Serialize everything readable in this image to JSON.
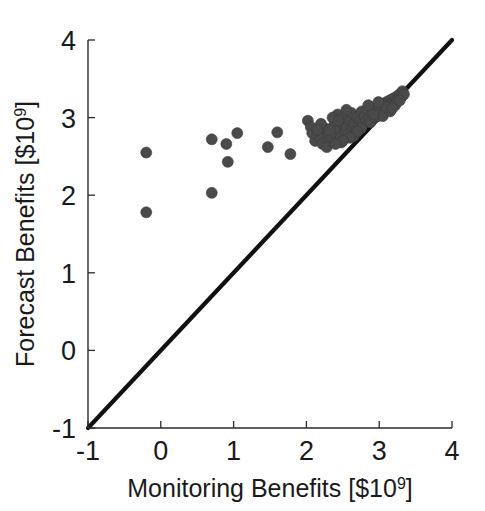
{
  "figure": {
    "background_color": "#ffffff",
    "axis_color": "#2b2b2b",
    "marker_color": "#4a4a4a",
    "line_color": "#111111"
  },
  "chart_data": {
    "type": "scatter",
    "title": "",
    "xlabel": "Monitoring Benefits [$10⁹]",
    "ylabel": "Forecast Benefits [$10⁹]",
    "xlabel_parts": {
      "text": "Monitoring Benefits [$10",
      "sup": "9",
      "tail": "]"
    },
    "ylabel_parts": {
      "text": "Forecast Benefits [$10",
      "sup": "9",
      "tail": "]"
    },
    "xlim": [
      -1,
      4
    ],
    "ylim": [
      -1,
      4
    ],
    "xticks": [
      -1,
      0,
      1,
      2,
      3,
      4
    ],
    "yticks": [
      -1,
      0,
      1,
      2,
      3,
      4
    ],
    "xtick_labels": [
      "-1",
      "0",
      "1",
      "2",
      "3",
      "4"
    ],
    "ytick_labels": [
      "-1",
      "0",
      "1",
      "2",
      "3",
      "4"
    ],
    "grid": false,
    "legend": null,
    "annotations": [],
    "reference_line": {
      "name": "one-to-one-line",
      "type": "identity",
      "from": [
        -1,
        -1
      ],
      "to": [
        4,
        4
      ]
    },
    "series": [
      {
        "name": "benefit pairs",
        "marker": "circle",
        "marker_size": 11,
        "color": "#4a4a4a",
        "points": [
          [
            -0.2,
            2.55
          ],
          [
            -0.2,
            1.78
          ],
          [
            0.7,
            2.72
          ],
          [
            0.7,
            2.03
          ],
          [
            0.9,
            2.66
          ],
          [
            0.92,
            2.43
          ],
          [
            1.05,
            2.8
          ],
          [
            1.47,
            2.62
          ],
          [
            1.6,
            2.81
          ],
          [
            1.78,
            2.53
          ],
          [
            2.02,
            2.96
          ],
          [
            2.06,
            2.88
          ],
          [
            2.12,
            2.7
          ],
          [
            2.18,
            2.75
          ],
          [
            2.22,
            2.66
          ],
          [
            2.26,
            2.86
          ],
          [
            2.3,
            2.79
          ],
          [
            2.34,
            2.72
          ],
          [
            2.38,
            2.9
          ],
          [
            2.4,
            2.8
          ],
          [
            2.43,
            3.04
          ],
          [
            2.45,
            2.84
          ],
          [
            2.47,
            2.74
          ],
          [
            2.5,
            2.92
          ],
          [
            2.52,
            3.0
          ],
          [
            2.54,
            2.82
          ],
          [
            2.56,
            2.88
          ],
          [
            2.58,
            2.79
          ],
          [
            2.6,
            2.96
          ],
          [
            2.62,
            3.06
          ],
          [
            2.64,
            2.86
          ],
          [
            2.66,
            2.92
          ],
          [
            2.68,
            2.83
          ],
          [
            2.7,
            3.0
          ],
          [
            2.72,
            2.9
          ],
          [
            2.74,
            2.97
          ],
          [
            2.76,
            3.08
          ],
          [
            2.78,
            2.93
          ],
          [
            2.8,
            3.02
          ],
          [
            2.82,
            2.96
          ],
          [
            2.84,
            3.1
          ],
          [
            2.86,
            3.0
          ],
          [
            2.88,
            2.94
          ],
          [
            2.9,
            3.06
          ],
          [
            2.92,
            3.12
          ],
          [
            2.94,
            3.0
          ],
          [
            2.96,
            3.08
          ],
          [
            2.98,
            3.02
          ],
          [
            3.0,
            3.14
          ],
          [
            3.02,
            3.06
          ],
          [
            3.04,
            3.1
          ],
          [
            3.06,
            3.18
          ],
          [
            3.08,
            3.12
          ],
          [
            3.1,
            3.2
          ],
          [
            3.12,
            3.14
          ],
          [
            3.14,
            3.22
          ],
          [
            3.16,
            3.18
          ],
          [
            3.18,
            3.24
          ],
          [
            3.2,
            3.2
          ],
          [
            3.22,
            3.26
          ],
          [
            3.24,
            3.22
          ],
          [
            3.26,
            3.28
          ],
          [
            3.28,
            3.3
          ],
          [
            3.3,
            3.26
          ],
          [
            3.32,
            3.34
          ],
          [
            3.34,
            3.3
          ],
          [
            2.36,
            3.0
          ],
          [
            2.48,
            2.68
          ],
          [
            2.2,
            2.92
          ],
          [
            2.28,
            2.62
          ],
          [
            2.55,
            3.1
          ],
          [
            2.65,
            2.76
          ],
          [
            2.85,
            3.16
          ],
          [
            3.05,
            3.02
          ],
          [
            3.15,
            3.08
          ],
          [
            2.75,
            2.86
          ],
          [
            2.44,
            2.96
          ],
          [
            2.32,
            2.84
          ],
          [
            2.92,
            3.04
          ],
          [
            3.1,
            3.14
          ],
          [
            2.99,
            3.2
          ],
          [
            3.22,
            3.16
          ],
          [
            2.7,
            2.82
          ],
          [
            2.6,
            2.74
          ],
          [
            2.5,
            2.7
          ],
          [
            2.4,
            2.66
          ],
          [
            3.18,
            3.12
          ],
          [
            3.28,
            3.22
          ],
          [
            2.08,
            2.8
          ],
          [
            2.15,
            2.84
          ]
        ]
      }
    ]
  }
}
